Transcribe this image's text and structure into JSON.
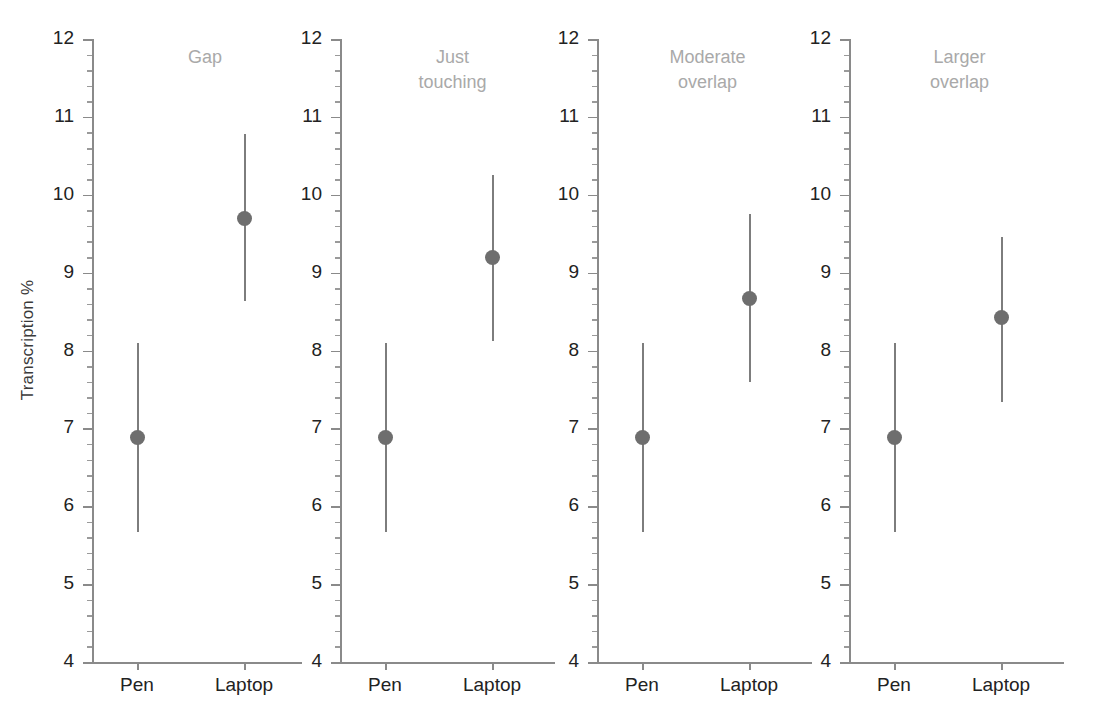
{
  "chart_data": {
    "type": "scatter",
    "title": "",
    "subtitle": "",
    "xlabel": "",
    "ylabel": "Transcription %",
    "ylim": [
      4,
      12
    ],
    "ytick_labels": [
      "12",
      "11",
      "10",
      "9",
      "8",
      "7",
      "6",
      "5",
      "4"
    ],
    "ytick_values": [
      12,
      11,
      10,
      9,
      8,
      7,
      6,
      5,
      4
    ],
    "minor_ticks_per_interval": 4,
    "grid": false,
    "legend": "none",
    "categories": [
      "Pen",
      "Laptop"
    ],
    "panels": [
      {
        "title": "Gap",
        "title_lines": [
          "Gap"
        ],
        "points": [
          {
            "category": "Pen",
            "value": 6.88,
            "ci_low": 5.67,
            "ci_high": 8.1
          },
          {
            "category": "Laptop",
            "value": 9.69,
            "ci_low": 8.63,
            "ci_high": 10.78
          }
        ]
      },
      {
        "title": "Just touching",
        "title_lines": [
          "Just",
          "touching"
        ],
        "points": [
          {
            "category": "Pen",
            "value": 6.88,
            "ci_low": 5.67,
            "ci_high": 8.1
          },
          {
            "category": "Laptop",
            "value": 9.19,
            "ci_low": 8.12,
            "ci_high": 10.25
          }
        ]
      },
      {
        "title": "Moderate overlap",
        "title_lines": [
          "Moderate",
          "overlap"
        ],
        "points": [
          {
            "category": "Pen",
            "value": 6.88,
            "ci_low": 5.67,
            "ci_high": 8.1
          },
          {
            "category": "Laptop",
            "value": 8.67,
            "ci_low": 7.6,
            "ci_high": 9.75
          }
        ]
      },
      {
        "title": "Larger overlap",
        "title_lines": [
          "Larger",
          "overlap"
        ],
        "points": [
          {
            "category": "Pen",
            "value": 6.88,
            "ci_low": 5.67,
            "ci_high": 8.1
          },
          {
            "category": "Laptop",
            "value": 8.42,
            "ci_low": 7.34,
            "ci_high": 9.46
          }
        ]
      }
    ],
    "colors": {
      "point": "#6e6e6e",
      "errorbar": "#7d7d7d",
      "axis": "#8a8a8a",
      "tick_label": "#222222",
      "panel_title": "#a9a9a9",
      "background": "#ffffff"
    }
  }
}
